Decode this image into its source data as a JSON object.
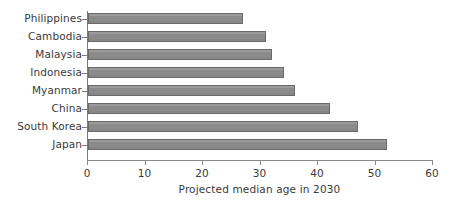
{
  "chart_data": {
    "type": "bar",
    "orientation": "horizontal",
    "title": "",
    "xlabel": "Projected median age in 2030",
    "ylabel": "",
    "categories": [
      "Philippines",
      "Cambodia",
      "Malaysia",
      "Indonesia",
      "Myanmar",
      "China",
      "South Korea",
      "Japan"
    ],
    "values": [
      27,
      31,
      32,
      34,
      36,
      42,
      47,
      52
    ],
    "xlim": [
      0,
      60
    ],
    "xticks": [
      0,
      10,
      20,
      30,
      40,
      50,
      60
    ],
    "xtick_labels": [
      "0",
      "10",
      "20",
      "30",
      "40",
      "50",
      "60"
    ],
    "grid": false,
    "legend": null,
    "series": [
      {
        "name": "Projected median age in 2030",
        "values": [
          27,
          31,
          32,
          34,
          36,
          42,
          47,
          52
        ]
      }
    ],
    "colors": {
      "bar_fill": "#8e8e8e",
      "bar_edge": "#6a6a6a",
      "axis": "#8a8a8a",
      "text": "#3a3a3a",
      "background": "#ffffff"
    }
  }
}
